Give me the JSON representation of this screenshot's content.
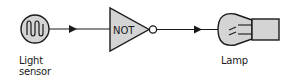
{
  "diagram": {
    "type": "block-diagram",
    "components": [
      {
        "id": "light-sensor",
        "label_line1": "Light",
        "label_line2": "sensor"
      },
      {
        "id": "not-gate",
        "label": "NOT"
      },
      {
        "id": "lamp",
        "label": "Lamp"
      }
    ],
    "connections": [
      {
        "from": "light-sensor",
        "to": "not-gate"
      },
      {
        "from": "not-gate",
        "to": "lamp"
      }
    ],
    "colors": {
      "stroke": "#1a1a1a",
      "fill": "#d4d4d4",
      "background": "#ffffff"
    }
  }
}
